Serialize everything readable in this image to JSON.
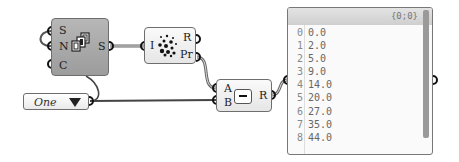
{
  "nodes": {
    "series": {
      "inputs": [
        "S",
        "N",
        "C"
      ],
      "outputs": [
        "S"
      ],
      "icon": "series-icon"
    },
    "random": {
      "inputs": [
        "I"
      ],
      "outputs": [
        "R",
        "Pr"
      ],
      "icon": "random-scatter-icon"
    },
    "subtraction": {
      "inputs": [
        "A",
        "B"
      ],
      "outputs": [
        "R"
      ],
      "icon": "minus-icon",
      "symbol": "-"
    },
    "value_list": {
      "selected": "One",
      "icon": "dropdown-triangle-icon"
    },
    "panel": {
      "path": "{0;0}",
      "rows": [
        {
          "index": "0",
          "value": "0.0"
        },
        {
          "index": "1",
          "value": "2.0"
        },
        {
          "index": "2",
          "value": "5.0"
        },
        {
          "index": "3",
          "value": "9.0"
        },
        {
          "index": "4",
          "value": "14.0"
        },
        {
          "index": "5",
          "value": "20.0"
        },
        {
          "index": "6",
          "value": "27.0"
        },
        {
          "index": "7",
          "value": "35.0"
        },
        {
          "index": "8",
          "value": "44.0"
        }
      ]
    }
  },
  "colors": {
    "wire": "#555555",
    "component_dark": "#a8a8a8",
    "component_light": "#f0f0f0"
  }
}
